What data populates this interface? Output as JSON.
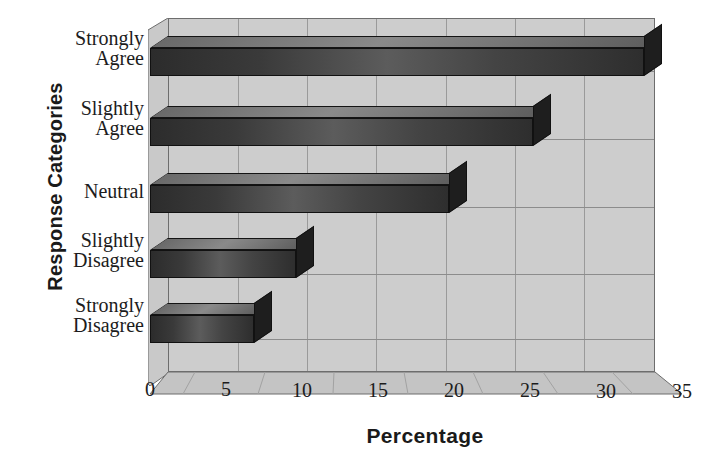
{
  "chart_data": {
    "type": "bar",
    "orientation": "horizontal",
    "style": "3d",
    "title": "",
    "xlabel": "Percentage",
    "ylabel": "Response Categories",
    "categories": [
      "Strongly Agree",
      "Slightly Agree",
      "Neutral",
      "Slightly Disagree",
      "Strongly Disagree"
    ],
    "category_lines": [
      [
        "Strongly",
        "Agree"
      ],
      [
        "Slightly",
        "Agree"
      ],
      [
        "Neutral",
        ""
      ],
      [
        "Slightly",
        "Disagree"
      ],
      [
        "Strongly",
        "Disagree"
      ]
    ],
    "values": [
      35.5,
      27.5,
      21.5,
      10.5,
      7.5
    ],
    "xlim": [
      0,
      35
    ],
    "xticks": [
      0,
      5,
      10,
      15,
      20,
      25,
      30,
      35
    ],
    "xtick_labels": [
      "0",
      "5",
      "10",
      "15",
      "20",
      "25",
      "30",
      "35"
    ],
    "grid": "vertical-and-horizontal",
    "legend": "none",
    "colors": {
      "bar_front_dark": "#2c2c2c",
      "bar_front_light": "#5c5c5c",
      "bar_top": "#575757",
      "bar_side": "#202020",
      "wall": "#cdcdcd",
      "floor": "#c4c4c4",
      "grid": "#9a9a9a",
      "axis_text": "#1c1c1c",
      "title_text": "#1a1a1a"
    }
  },
  "axis": {
    "x_title": "Percentage",
    "y_title": "Response Categories"
  }
}
